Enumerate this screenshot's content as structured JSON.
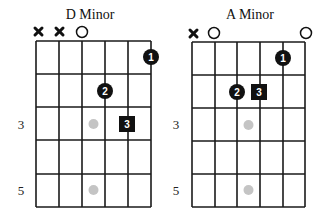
{
  "colors": {
    "grid": "#1a1a1a",
    "finger": "#111111",
    "inlay": "#c4c4c4",
    "text": "#111111",
    "background": "#ffffff"
  },
  "diagrams": [
    {
      "title": "D Minor",
      "string_markers": [
        "x",
        "x",
        "o",
        "",
        "",
        ""
      ],
      "fret_labels": [
        {
          "fret": 3,
          "label": "3"
        },
        {
          "fret": 5,
          "label": "5"
        }
      ],
      "fingers": [
        {
          "label": "1",
          "string": 6,
          "fret": 1,
          "shape": "circle"
        },
        {
          "label": "2",
          "string": 4,
          "fret": 2,
          "shape": "circle"
        },
        {
          "label": "3",
          "string": 5,
          "fret": 3,
          "shape": "square"
        }
      ],
      "inlays": [
        {
          "fret": 3
        },
        {
          "fret": 5
        }
      ]
    },
    {
      "title": "A Minor",
      "string_markers": [
        "x",
        "o",
        "",
        "",
        "",
        "o"
      ],
      "fret_labels": [
        {
          "fret": 3,
          "label": "3"
        },
        {
          "fret": 5,
          "label": "5"
        }
      ],
      "fingers": [
        {
          "label": "1",
          "string": 5,
          "fret": 1,
          "shape": "circle"
        },
        {
          "label": "2",
          "string": 3,
          "fret": 2,
          "shape": "circle"
        },
        {
          "label": "3",
          "string": 4,
          "fret": 2,
          "shape": "square"
        }
      ],
      "inlays": [
        {
          "fret": 3
        },
        {
          "fret": 5
        }
      ]
    }
  ]
}
